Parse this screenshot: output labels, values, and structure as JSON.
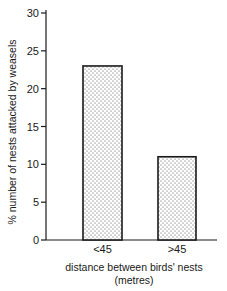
{
  "chart_data": {
    "type": "bar",
    "title": "",
    "categories": [
      "<45",
      ">45"
    ],
    "values": [
      23,
      11
    ],
    "xlabel": "distance between birds' nests",
    "xlabel_unit": "(metres)",
    "ylabel": "% number of nests attacked by weasels",
    "ylim": [
      0,
      30
    ],
    "yticks": [
      0,
      5,
      10,
      15,
      20,
      25,
      30
    ],
    "grid": false,
    "legend": null,
    "bar_fill": "stippled dot pattern",
    "bar_color": "#ffffff",
    "edge_color": "#1a1a1a"
  }
}
